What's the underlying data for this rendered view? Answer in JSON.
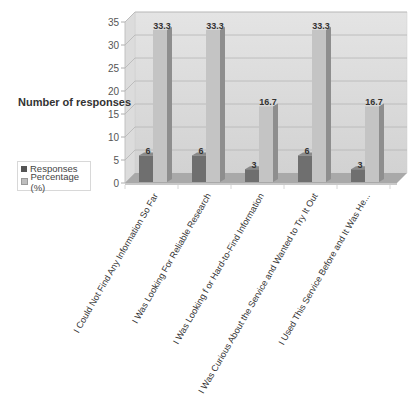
{
  "chart_data": {
    "type": "bar",
    "style": "3d-clustered-column",
    "title": "",
    "xlabel": "",
    "ylabel": "Number of responses",
    "ylim": [
      0,
      35
    ],
    "yticks": [
      0,
      5,
      10,
      15,
      20,
      25,
      30,
      35
    ],
    "grid": true,
    "legend_position": "left",
    "categories": [
      "I Could Not Find Any Information So Far",
      "I Was Looking For Reliable Research",
      "I Was Looking f or Hard-to-Find Information",
      "I Was Curious About the Service and Wanted to Try It Out",
      "I Used This Service Before and It Was He..."
    ],
    "series": [
      {
        "name": "Responses",
        "color": "#6e6e6e",
        "values": [
          6,
          6,
          3,
          6,
          3
        ],
        "labels": [
          "6",
          "6",
          "3",
          "6",
          "3"
        ]
      },
      {
        "name": "Percentage (%)",
        "color": "#bdbdbd",
        "values": [
          33.3,
          33.3,
          16.7,
          33.3,
          16.7
        ],
        "labels": [
          "33.3",
          "33.3",
          "16.7",
          "33.3",
          "16.7"
        ]
      }
    ]
  },
  "legend": {
    "items": [
      {
        "label": "Responses",
        "color": "#6e6e6e"
      },
      {
        "label": "Percentage (%)",
        "color": "#bdbdbd"
      }
    ]
  },
  "axis": {
    "ylabel": "Number of responses"
  }
}
